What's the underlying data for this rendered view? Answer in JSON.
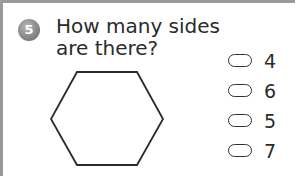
{
  "question": {
    "number": "5",
    "text_line1": "How many sides",
    "text_line2": "are there?",
    "shape": "hexagon"
  },
  "options": [
    {
      "label": "4"
    },
    {
      "label": "6"
    },
    {
      "label": "5"
    },
    {
      "label": "7"
    }
  ],
  "colors": {
    "frame": "#9a9a9a",
    "badge": "#7c7c7c",
    "text": "#2b2b2b"
  }
}
